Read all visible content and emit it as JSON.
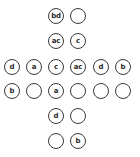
{
  "diagram": {
    "type": "cross-shaped grid of circles",
    "colors": {
      "stroke": "#3a3a3a",
      "text": "#2a2a2a",
      "background": "#ffffff"
    },
    "cells": [
      {
        "row": 1,
        "col": 3,
        "x": 56,
        "y": 16,
        "label": "bd"
      },
      {
        "row": 1,
        "col": 4,
        "x": 78,
        "y": 16,
        "label": ""
      },
      {
        "row": 2,
        "col": 3,
        "x": 56,
        "y": 41,
        "label": "ac"
      },
      {
        "row": 2,
        "col": 4,
        "x": 78,
        "y": 41,
        "label": "c"
      },
      {
        "row": 3,
        "col": 1,
        "x": 12,
        "y": 67,
        "label": "d"
      },
      {
        "row": 3,
        "col": 2,
        "x": 34,
        "y": 67,
        "label": "a"
      },
      {
        "row": 3,
        "col": 3,
        "x": 56,
        "y": 67,
        "label": "c"
      },
      {
        "row": 3,
        "col": 4,
        "x": 78,
        "y": 67,
        "label": "ac"
      },
      {
        "row": 3,
        "col": 5,
        "x": 101,
        "y": 67,
        "label": "d"
      },
      {
        "row": 3,
        "col": 6,
        "x": 123,
        "y": 67,
        "label": "b"
      },
      {
        "row": 4,
        "col": 1,
        "x": 12,
        "y": 91,
        "label": "b"
      },
      {
        "row": 4,
        "col": 2,
        "x": 34,
        "y": 91,
        "label": ""
      },
      {
        "row": 4,
        "col": 3,
        "x": 56,
        "y": 91,
        "label": "a"
      },
      {
        "row": 4,
        "col": 4,
        "x": 78,
        "y": 91,
        "label": ""
      },
      {
        "row": 4,
        "col": 5,
        "x": 101,
        "y": 91,
        "label": ""
      },
      {
        "row": 4,
        "col": 6,
        "x": 123,
        "y": 91,
        "label": ""
      },
      {
        "row": 5,
        "col": 3,
        "x": 56,
        "y": 116,
        "label": "d"
      },
      {
        "row": 5,
        "col": 4,
        "x": 78,
        "y": 116,
        "label": ""
      },
      {
        "row": 6,
        "col": 3,
        "x": 56,
        "y": 141,
        "label": ""
      },
      {
        "row": 6,
        "col": 4,
        "x": 78,
        "y": 141,
        "label": "b"
      }
    ]
  }
}
